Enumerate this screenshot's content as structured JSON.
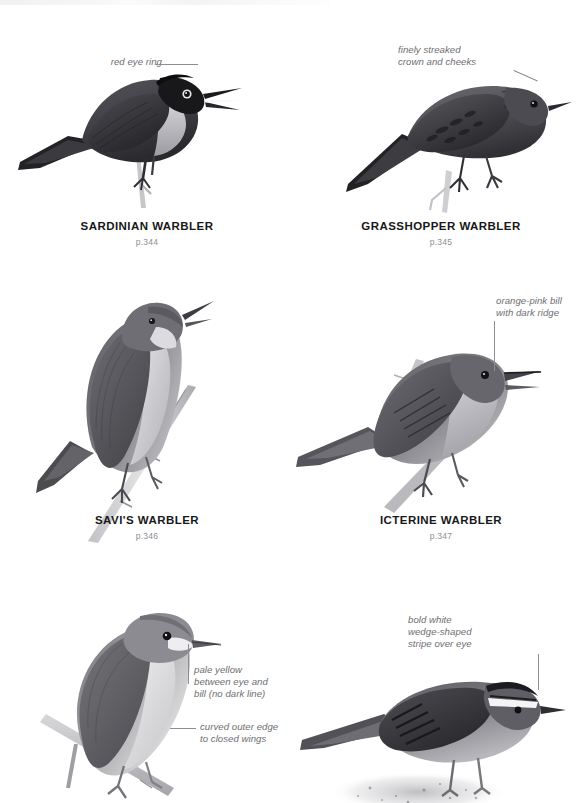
{
  "page": {
    "background_color": "#ffffff",
    "running_head_visible": true
  },
  "style": {
    "species_name_color": "#18181a",
    "page_ref_color": "#8e8e92",
    "callout_color": "#6d6d72",
    "leader_line_color": "#8d8d92",
    "plumage_dark": "#2b2b2d",
    "plumage_mid": "#6f6f73",
    "plumage_light": "#c9c9cc",
    "plumage_pale": "#ececef"
  },
  "plates": [
    {
      "id": "sardinian-warbler",
      "species_name": "SARDINIAN WARBLER",
      "page_ref": "p.344",
      "callout": "red eye ring",
      "callout_lines": 1
    },
    {
      "id": "grasshopper-warbler",
      "species_name": "GRASSHOPPER WARBLER",
      "page_ref": "p.345",
      "callout": "finely streaked\ncrown and cheeks",
      "callout_lines": 2
    },
    {
      "id": "savis-warbler",
      "species_name": "SAVI'S WARBLER",
      "page_ref": "p.346",
      "callout": "curved outer edge\nto closed wings",
      "callout_lines": 2
    },
    {
      "id": "icterine-warbler",
      "species_name": "ICTERINE WARBLER",
      "page_ref": "p.347",
      "callout": "orange-pink bill\nwith dark ridge",
      "callout_lines": 2
    },
    {
      "id": "bottom-left-warbler",
      "species_name": "",
      "page_ref": "",
      "callout": "pale yellow\nbetween eye and\nbill (no dark line)",
      "callout_lines": 3
    },
    {
      "id": "bottom-right-warbler",
      "species_name": "",
      "page_ref": "",
      "callout": "bold white\nwedge-shaped\nstripe over eye",
      "callout_lines": 3
    }
  ]
}
